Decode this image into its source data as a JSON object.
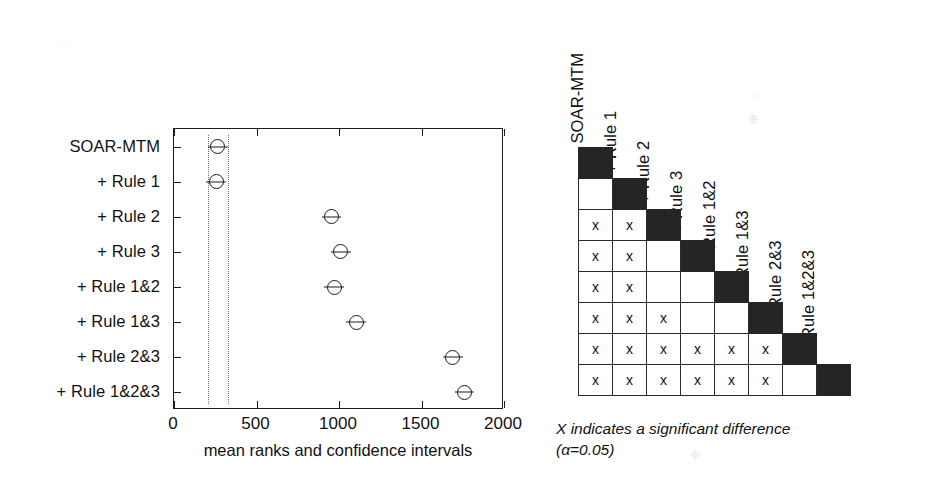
{
  "chart_data": [
    {
      "type": "scatter",
      "id": "mean-ranks-ci-plot",
      "title": "",
      "xlabel": "mean ranks and confidence intervals",
      "ylabel": "",
      "xlim": [
        0,
        2000
      ],
      "xticks": [
        0,
        500,
        1000,
        1500,
        2000
      ],
      "xticklabels": [
        "0",
        "500",
        "1000",
        "1500",
        "2000"
      ],
      "grid": false,
      "legend": "none",
      "orientation": "horizontal",
      "categories": [
        "SOAR-MTM",
        "+ Rule 1",
        "+ Rule 2",
        "+ Rule 3",
        "+ Rule 1&2",
        "+ Rule 1&3",
        "+ Rule 2&3",
        "+ Rule 1&2&3"
      ],
      "values": [
        265,
        255,
        955,
        1010,
        970,
        1105,
        1690,
        1760
      ],
      "ci_low": [
        205,
        195,
        895,
        950,
        910,
        1045,
        1630,
        1700
      ],
      "ci_high": [
        325,
        315,
        1015,
        1070,
        1030,
        1165,
        1750,
        1820
      ],
      "reference_lines": [
        205,
        325
      ]
    },
    {
      "type": "heatmap",
      "id": "significance-matrix",
      "title": "",
      "grid": true,
      "legend": "none",
      "categories": [
        "SOAR-MTM",
        "+ Rule 1",
        "+ Rule 2",
        "+ Rule 3",
        "+ Rule 1&2",
        "+ Rule 1&3",
        "+ Rule 2&3",
        "+ Rule 1&2&3"
      ],
      "cell_mark": "x",
      "rows": [
        [
          "diag"
        ],
        [
          "",
          "diag"
        ],
        [
          "x",
          "x",
          "diag"
        ],
        [
          "x",
          "x",
          "",
          "diag"
        ],
        [
          "x",
          "x",
          "",
          "",
          "diag"
        ],
        [
          "x",
          "x",
          "x",
          "",
          "",
          "diag"
        ],
        [
          "x",
          "x",
          "x",
          "x",
          "x",
          "x",
          "diag"
        ],
        [
          "x",
          "x",
          "x",
          "x",
          "x",
          "x",
          "",
          "diag"
        ]
      ],
      "caption_line1": "X indicates a significant difference",
      "caption_line2": "(α=0.05)"
    }
  ],
  "dotplot": {
    "name": "mean ranks and confidence intervals plot",
    "axis_title": "mean ranks and confidence intervals",
    "xticklabels": [
      "0",
      "500",
      "1000",
      "1500",
      "2000"
    ],
    "categories": [
      "SOAR-MTM",
      "+ Rule 1",
      "+ Rule 2",
      "+ Rule 3",
      "+ Rule 1&2",
      "+ Rule 1&3",
      "+ Rule 2&3",
      "+ Rule 1&2&3"
    ]
  },
  "matrix": {
    "name": "pairwise significant difference matrix",
    "column_headers": [
      "SOAR-MTM",
      "+ Rule 1",
      "+ Rule 2",
      "+ Rule 3",
      "+ Rule 1&2",
      "+ Rule 1&3",
      "+ Rule 2&3",
      "+ Rule 1&2&3"
    ],
    "mark": "x",
    "caption_line1": "X indicates a significant difference",
    "caption_line2": "(α=0.05)"
  },
  "colors": {
    "ink": "#1a1a1a",
    "diagonal_fill": "#252525",
    "cell_border": "#2b2b2b",
    "reference_line": "#6d6d6d",
    "background": "#ffffff",
    "artifact": "#e9e9e9"
  }
}
